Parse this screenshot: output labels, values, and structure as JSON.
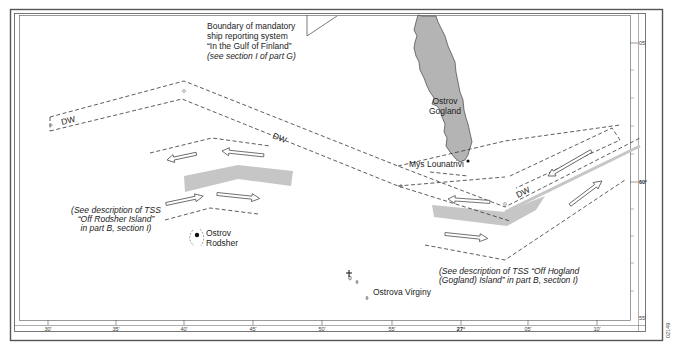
{
  "map": {
    "type": "nautical-chart",
    "labels": {
      "boundary_note": {
        "lines": [
          "Boundary of mandatory",
          "ship reporting system",
          "“In the Gulf of Finland”"
        ],
        "italic_line": "(see section I of part G)"
      },
      "gogland": [
        "Ostrov",
        "Gogland"
      ],
      "mys_lounatrivi": "Mys Lounatrivi",
      "rodsher": [
        "Ostrov",
        "Rodsher"
      ],
      "virginy": "Ostrova Virginy",
      "tss_rodsher_note": [
        "(See description of TSS",
        "“Off Rodsher Island”",
        "in part B, section I)"
      ],
      "tss_hogland_note": [
        "(See description of TSS “Off Hogland",
        "(Gogland) Island” in part B, section I)"
      ],
      "dw_labels": [
        "DW",
        "DW",
        "DW"
      ]
    },
    "longitude_scale": {
      "ticks": [
        {
          "label": "30'",
          "x": 48
        },
        {
          "label": "35'",
          "x": 116
        },
        {
          "label": "40'",
          "x": 184
        },
        {
          "label": "45'",
          "x": 253
        },
        {
          "label": "50'",
          "x": 322
        },
        {
          "label": "55'",
          "x": 392
        },
        {
          "label": "27°",
          "x": 461,
          "bold": true
        },
        {
          "label": "05'",
          "x": 528
        },
        {
          "label": "10'",
          "x": 597
        }
      ]
    },
    "latitude_scale": {
      "ticks": [
        {
          "label": "05'",
          "y": 43
        },
        {
          "label": "60°",
          "y": 182,
          "bold": true
        },
        {
          "label": "55'",
          "y": 318
        }
      ]
    },
    "figure_id": "02149",
    "colors": {
      "land": "#b4b4b4",
      "separation_zone": "#c6c6c6",
      "frame": "#555555",
      "text": "#222222"
    }
  }
}
